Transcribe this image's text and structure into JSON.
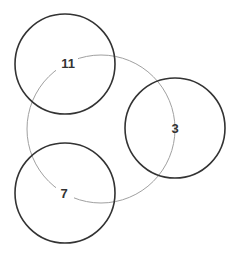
{
  "diagram": {
    "ring": {
      "cx": 101,
      "cy": 129,
      "r": 74,
      "stroke": "#999999"
    },
    "nodes": [
      {
        "label": "11",
        "cx": 65,
        "cy": 64,
        "r": 50
      },
      {
        "label": "3",
        "cx": 175,
        "cy": 128,
        "r": 50
      },
      {
        "label": "7",
        "cx": 65,
        "cy": 193,
        "r": 50
      }
    ],
    "node_stroke": "#333333"
  }
}
